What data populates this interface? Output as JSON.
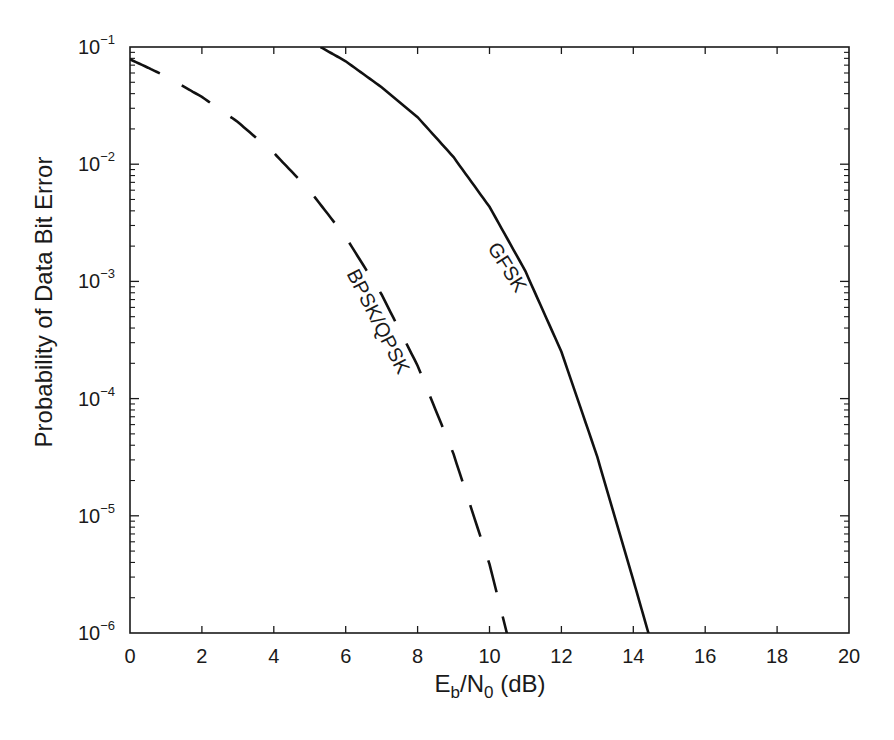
{
  "chart_data": {
    "type": "line",
    "title": "",
    "xlabel": "Eb/N0 (dB)",
    "xlabel_parts": {
      "main": "E",
      "sub1": "b",
      "mid": "/N",
      "sub2": "0",
      "tail": " (dB)"
    },
    "ylabel": "Probability of Data Bit Error",
    "xlim": [
      0,
      20
    ],
    "ylim": [
      1e-06,
      0.1
    ],
    "yscale": "log",
    "grid": false,
    "legend": "none (inline curve labels)",
    "x_ticks": [
      0,
      2,
      4,
      6,
      8,
      10,
      12,
      14,
      16,
      18,
      20
    ],
    "y_ticks": [
      {
        "value": 0.1,
        "base": "10",
        "exp": "−1"
      },
      {
        "value": 0.01,
        "base": "10",
        "exp": "−2"
      },
      {
        "value": 0.001,
        "base": "10",
        "exp": "−3"
      },
      {
        "value": 0.0001,
        "base": "10",
        "exp": "−4"
      },
      {
        "value": 1e-05,
        "base": "10",
        "exp": "−5"
      },
      {
        "value": 1e-06,
        "base": "10",
        "exp": "−6"
      }
    ],
    "series": [
      {
        "name": "BPSK/QPSK",
        "style": "dashed",
        "color": "#111111",
        "x": [
          0,
          1,
          2,
          3,
          4,
          5,
          6,
          7,
          8,
          9,
          10,
          10.5
        ],
        "values": [
          0.0786,
          0.0563,
          0.0375,
          0.0229,
          0.0125,
          0.00595,
          0.00239,
          0.000773,
          0.000191,
          3.36e-05,
          3.87e-06,
          9.5e-07
        ]
      },
      {
        "name": "GFSK",
        "style": "solid",
        "color": "#111111",
        "x": [
          5.3,
          6,
          7,
          8,
          9,
          10,
          11,
          12,
          13,
          14,
          14.4
        ],
        "values": [
          0.1,
          0.0755,
          0.0453,
          0.0252,
          0.0115,
          0.00433,
          0.00122,
          0.000251,
          3.17e-05,
          2.83e-06,
          1.05e-06
        ]
      }
    ],
    "annotations": [
      {
        "text": "BPSK/QPSK",
        "x": 7.0,
        "y": 0.0009,
        "rotation_deg": 63
      },
      {
        "text": "GFSK",
        "x": 10.4,
        "y": 0.0031,
        "rotation_deg": 58
      }
    ]
  },
  "ui": {
    "accent": "#111111",
    "background": "#ffffff"
  }
}
